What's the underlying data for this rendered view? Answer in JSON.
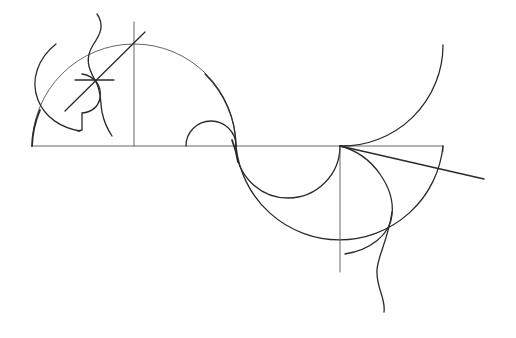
{
  "figure": {
    "colors": {
      "background": "#ffffff",
      "ink": "#2a2a2a",
      "light_ink": "#555555"
    },
    "baseline": {
      "x1": 32,
      "y": 146,
      "x2": 443
    },
    "elements": [
      "baseline",
      "left-vertical-axis",
      "upper-large-arc",
      "upper-small-semicircle",
      "lower-small-semicircle",
      "lower-large-arc",
      "right-vertical-axis",
      "upper-right-arc",
      "diagonal-ray",
      "inner-lower-arc",
      "wavy-line-bottom",
      "wavy-line-top",
      "profile-head",
      "cross-mark",
      "diagonal-line-upper-left"
    ]
  }
}
